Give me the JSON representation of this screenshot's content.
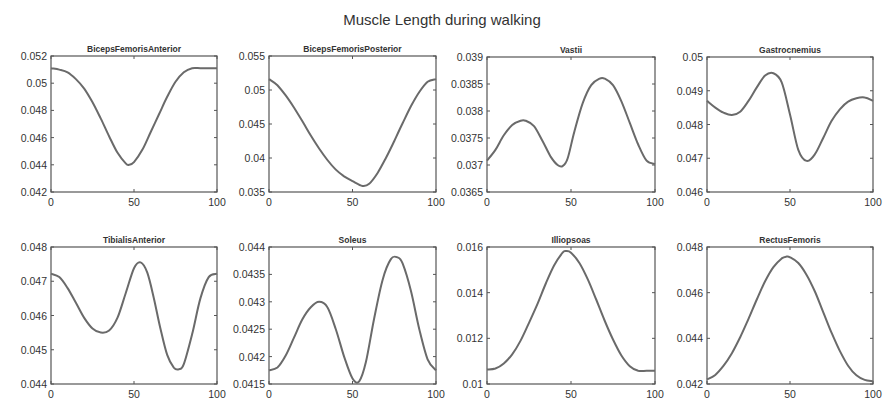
{
  "chart_data": [
    {
      "type": "line",
      "title": "BicepsFemorisAnterior",
      "xlabel": "",
      "ylabel": "",
      "xlim": [
        0,
        100
      ],
      "ylim": [
        0.042,
        0.052
      ],
      "xticks": [
        "0",
        "50",
        "100"
      ],
      "yticks": [
        "0.042",
        "0.044",
        "0.046",
        "0.048",
        "0.05",
        "0.052"
      ],
      "x": [
        0,
        5,
        10,
        15,
        20,
        25,
        30,
        35,
        40,
        45,
        47,
        50,
        55,
        60,
        65,
        70,
        75,
        80,
        85,
        90,
        95,
        100
      ],
      "values": [
        0.0511,
        0.051,
        0.0508,
        0.0503,
        0.0496,
        0.0486,
        0.0474,
        0.0461,
        0.0449,
        0.0441,
        0.044,
        0.0442,
        0.0451,
        0.0464,
        0.0477,
        0.049,
        0.0501,
        0.0508,
        0.0511,
        0.0511,
        0.0511,
        0.0511
      ]
    },
    {
      "type": "line",
      "title": "BicepsFemorisPosterior",
      "xlabel": "",
      "ylabel": "",
      "xlim": [
        0,
        100
      ],
      "ylim": [
        0.035,
        0.055
      ],
      "xticks": [
        "0",
        "50",
        "100"
      ],
      "yticks": [
        "0.035",
        "0.04",
        "0.045",
        "0.05",
        "0.055"
      ],
      "x": [
        0,
        5,
        10,
        15,
        20,
        25,
        30,
        35,
        40,
        45,
        50,
        56,
        60,
        65,
        70,
        75,
        80,
        85,
        90,
        95,
        100
      ],
      "values": [
        0.0516,
        0.0507,
        0.0492,
        0.0474,
        0.0454,
        0.0433,
        0.0414,
        0.0397,
        0.0383,
        0.0373,
        0.0366,
        0.0359,
        0.0362,
        0.0378,
        0.04,
        0.0425,
        0.0451,
        0.0476,
        0.0497,
        0.0512,
        0.0516
      ]
    },
    {
      "type": "line",
      "title": "Vastii",
      "xlabel": "",
      "ylabel": "",
      "xlim": [
        0,
        100
      ],
      "ylim": [
        0.0365,
        0.039
      ],
      "xticks": [
        "0",
        "50",
        "100"
      ],
      "yticks": [
        "0.0365",
        "0.037",
        "0.0375",
        "0.038",
        "0.0385",
        "0.039"
      ],
      "x": [
        0,
        5,
        10,
        15,
        20,
        23,
        28,
        33,
        38,
        42,
        45,
        48,
        52,
        57,
        62,
        67,
        70,
        75,
        80,
        85,
        90,
        95,
        100
      ],
      "values": [
        0.03708,
        0.03728,
        0.03755,
        0.03774,
        0.03782,
        0.03782,
        0.03772,
        0.03745,
        0.03715,
        0.037,
        0.03698,
        0.03712,
        0.03762,
        0.03815,
        0.03848,
        0.0386,
        0.0386,
        0.03848,
        0.03818,
        0.03778,
        0.03738,
        0.03708,
        0.03702
      ]
    },
    {
      "type": "line",
      "title": "Gastrocnemius",
      "xlabel": "",
      "ylabel": "",
      "xlim": [
        0,
        100
      ],
      "ylim": [
        0.046,
        0.05
      ],
      "xticks": [
        "0",
        "50",
        "100"
      ],
      "yticks": [
        "0.046",
        "0.047",
        "0.048",
        "0.049",
        "0.05"
      ],
      "x": [
        0,
        5,
        10,
        15,
        20,
        25,
        30,
        35,
        40,
        45,
        50,
        55,
        60,
        65,
        70,
        75,
        80,
        85,
        90,
        95,
        100
      ],
      "values": [
        0.0487,
        0.0485,
        0.04835,
        0.04828,
        0.04838,
        0.0487,
        0.0491,
        0.04945,
        0.04952,
        0.04925,
        0.0483,
        0.04725,
        0.04692,
        0.04712,
        0.0476,
        0.0481,
        0.04845,
        0.04868,
        0.04878,
        0.0488,
        0.0487
      ]
    },
    {
      "type": "line",
      "title": "TibialisAnterior",
      "xlabel": "",
      "ylabel": "",
      "xlim": [
        0,
        100
      ],
      "ylim": [
        0.044,
        0.048
      ],
      "xticks": [
        "0",
        "50",
        "100"
      ],
      "yticks": [
        "0.044",
        "0.045",
        "0.046",
        "0.047",
        "0.048"
      ],
      "x": [
        0,
        5,
        10,
        15,
        20,
        25,
        30,
        35,
        40,
        45,
        50,
        54,
        58,
        62,
        66,
        70,
        74,
        77,
        80,
        85,
        90,
        95,
        100
      ],
      "values": [
        0.04722,
        0.04712,
        0.0468,
        0.04637,
        0.04593,
        0.04562,
        0.0455,
        0.04556,
        0.04593,
        0.04665,
        0.04738,
        0.04755,
        0.04725,
        0.0465,
        0.0456,
        0.04485,
        0.04448,
        0.04443,
        0.04458,
        0.04545,
        0.0465,
        0.04712,
        0.04722
      ]
    },
    {
      "type": "line",
      "title": "Soleus",
      "xlabel": "",
      "ylabel": "",
      "xlim": [
        0,
        100
      ],
      "ylim": [
        0.0415,
        0.044
      ],
      "xticks": [
        "0",
        "50",
        "100"
      ],
      "yticks": [
        "0.0415",
        "0.042",
        "0.0425",
        "0.043",
        "0.0435",
        "0.044"
      ],
      "x": [
        0,
        5,
        10,
        15,
        20,
        25,
        30,
        35,
        40,
        45,
        50,
        54,
        58,
        63,
        68,
        73,
        77,
        80,
        85,
        90,
        95,
        100
      ],
      "values": [
        0.04175,
        0.0418,
        0.04202,
        0.04235,
        0.04268,
        0.0429,
        0.043,
        0.0429,
        0.0425,
        0.042,
        0.0416,
        0.04155,
        0.0419,
        0.0427,
        0.0434,
        0.04378,
        0.04381,
        0.0437,
        0.0432,
        0.0425,
        0.04195,
        0.04175
      ]
    },
    {
      "type": "line",
      "title": "Illiopsoas",
      "xlabel": "",
      "ylabel": "",
      "xlim": [
        0,
        100
      ],
      "ylim": [
        0.01,
        0.016
      ],
      "xticks": [
        "0",
        "50",
        "100"
      ],
      "yticks": [
        "0.01",
        "0.012",
        "0.014",
        "0.016"
      ],
      "x": [
        0,
        5,
        10,
        15,
        20,
        25,
        30,
        35,
        40,
        45,
        47,
        50,
        55,
        60,
        65,
        70,
        75,
        80,
        85,
        90,
        95,
        100
      ],
      "values": [
        0.01063,
        0.01068,
        0.0109,
        0.0113,
        0.0119,
        0.01268,
        0.0135,
        0.0144,
        0.0152,
        0.01575,
        0.01582,
        0.01575,
        0.0153,
        0.01458,
        0.0137,
        0.01278,
        0.01195,
        0.01125,
        0.01078,
        0.01058,
        0.01058,
        0.01058
      ]
    },
    {
      "type": "line",
      "title": "RectusFemoris",
      "xlabel": "",
      "ylabel": "",
      "xlim": [
        0,
        100
      ],
      "ylim": [
        0.042,
        0.048
      ],
      "xticks": [
        "0",
        "50",
        "100"
      ],
      "yticks": [
        "0.042",
        "0.044",
        "0.046",
        "0.048"
      ],
      "x": [
        0,
        5,
        10,
        15,
        20,
        25,
        30,
        35,
        40,
        45,
        48,
        50,
        55,
        60,
        65,
        70,
        75,
        80,
        85,
        90,
        95,
        100
      ],
      "values": [
        0.0422,
        0.0424,
        0.0428,
        0.04335,
        0.04405,
        0.04485,
        0.0457,
        0.0465,
        0.04712,
        0.0475,
        0.04758,
        0.04755,
        0.0473,
        0.04678,
        0.04605,
        0.04515,
        0.04425,
        0.04345,
        0.0428,
        0.04238,
        0.04218,
        0.04212
      ]
    }
  ],
  "figure": {
    "title": "Muscle Length during walking",
    "colors": {
      "curve": "#6a6a6a",
      "axes": "#555555",
      "text": "#333333"
    }
  }
}
